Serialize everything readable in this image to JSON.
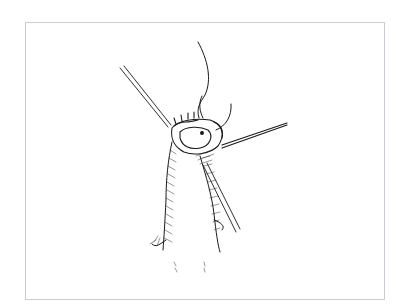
{
  "figure": {
    "frame_color": "#c9ccd6",
    "ink_color": "#1a1a1a",
    "background": "#ffffff"
  }
}
